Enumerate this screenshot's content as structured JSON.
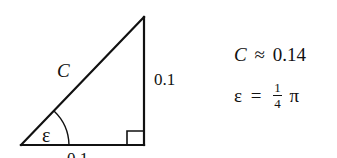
{
  "diagram": {
    "type": "right-triangle",
    "hypotenuse_label": "C",
    "vertical_side_label": "0.1",
    "bottom_side_label": "0.1",
    "angle_label": "ε",
    "right_angle_marker": true
  },
  "equations": {
    "c_lhs": "C",
    "c_rel": "≈",
    "c_value": "0.14",
    "eps_lhs": "ε",
    "eps_rel": "=",
    "eps_frac_num": "1",
    "eps_frac_den": "4",
    "eps_tail": "π"
  },
  "colors": {
    "stroke": "#111111",
    "background": "#ffffff"
  }
}
